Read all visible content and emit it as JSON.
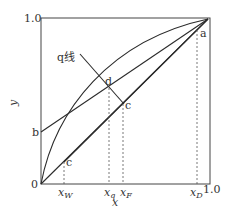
{
  "diagram": {
    "type": "McCabe-Thiele x-y diagram",
    "axes": {
      "x_label": "x",
      "y_label": "y",
      "y_top_tick": "1.0",
      "origin_tick": "0",
      "x_right_tick": "1.0"
    },
    "x_markers": {
      "xW": "x",
      "xW_sub": "W",
      "xq": "x",
      "xq_sub": "q",
      "xF": "x",
      "xF_sub": "F",
      "xD": "x",
      "xD_sub": "D"
    },
    "points": {
      "a": "a",
      "b": "b",
      "c_upper": "c",
      "c_lower": "c",
      "d": "d"
    },
    "q_line_label": "q线",
    "colors": {
      "line": "#2b2b2b",
      "dashed": "#555555",
      "text": "#333333"
    }
  }
}
